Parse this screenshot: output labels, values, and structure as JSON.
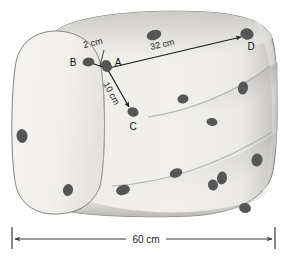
{
  "figure": {
    "colors": {
      "background": "#ffffff",
      "cheese_light": "#f1f0ec",
      "cheese_mid": "#e2e1dc",
      "cheese_shade": "#b9b8b4",
      "cheese_deep_shade": "#9b9a96",
      "hole": "#565656",
      "outline": "#6d6d6b",
      "annotation": "#1a1a1a"
    }
  },
  "measurements": {
    "ab": {
      "label": "2 cm",
      "value": 2,
      "unit": "cm",
      "from": "A",
      "to": "B"
    },
    "ad": {
      "label": "32 cm",
      "value": 32,
      "unit": "cm",
      "from": "A",
      "to": "D"
    },
    "ac": {
      "label": "10 cm",
      "value": 10,
      "unit": "cm",
      "from": "A",
      "to": "C"
    },
    "width": {
      "label": "60 cm",
      "value": 60,
      "unit": "cm"
    }
  },
  "points": {
    "a": "A",
    "b": "B",
    "c": "C",
    "d": "D"
  },
  "holes": [
    {
      "cx": 154,
      "cy": 35,
      "rx": 7.5,
      "ry": 5.0,
      "rot": -18
    },
    {
      "cx": 247,
      "cy": 34,
      "rx": 6.5,
      "ry": 5.5,
      "rot": 12
    },
    {
      "cx": 88,
      "cy": 62,
      "rx": 5.5,
      "ry": 4.2,
      "rot": -10
    },
    {
      "cx": 106,
      "cy": 65,
      "rx": 5.0,
      "ry": 5.0,
      "rot": 0
    },
    {
      "cx": 133,
      "cy": 112,
      "rx": 5.5,
      "ry": 4.5,
      "rot": 18
    },
    {
      "cx": 183,
      "cy": 99,
      "rx": 5.5,
      "ry": 4.5,
      "rot": -8
    },
    {
      "cx": 243,
      "cy": 88,
      "rx": 5.0,
      "ry": 6.5,
      "rot": 10
    },
    {
      "cx": 212,
      "cy": 122,
      "rx": 5.5,
      "ry": 4.0,
      "rot": 8
    },
    {
      "cx": 22,
      "cy": 136,
      "rx": 5.5,
      "ry": 7.0,
      "rot": -6
    },
    {
      "cx": 257,
      "cy": 160,
      "rx": 5.5,
      "ry": 6.5,
      "rot": 14
    },
    {
      "cx": 68,
      "cy": 190,
      "rx": 5.0,
      "ry": 6.0,
      "rot": 16
    },
    {
      "cx": 123,
      "cy": 190,
      "rx": 7.0,
      "ry": 5.0,
      "rot": -14
    },
    {
      "cx": 176,
      "cy": 173,
      "rx": 6.5,
      "ry": 4.5,
      "rot": -20
    },
    {
      "cx": 222,
      "cy": 178,
      "rx": 5.0,
      "ry": 6.5,
      "rot": 8
    },
    {
      "cx": 213,
      "cy": 185,
      "rx": 5.0,
      "ry": 5.5,
      "rot": -10
    },
    {
      "cx": 245,
      "cy": 208,
      "rx": 6.0,
      "ry": 5.0,
      "rot": 12
    }
  ],
  "geometry": {
    "a": {
      "x": 107,
      "y": 67
    },
    "b": {
      "x": 89,
      "y": 62
    },
    "c": {
      "x": 133,
      "y": 113
    },
    "d": {
      "x": 247,
      "y": 34
    }
  }
}
